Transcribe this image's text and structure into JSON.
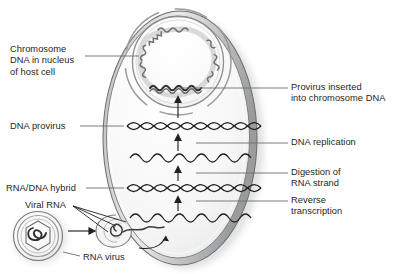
{
  "figure": {
    "type": "biological-process-diagram"
  },
  "colors": {
    "ink": "#231f20",
    "membrane_dark": "#58595b",
    "membrane_mid": "#8c8d8f",
    "membrane_light": "#d9dada",
    "cytoplasm": "#f2f2f2",
    "nucleus_fill": "#fbfbfb",
    "leader_line": "#6d6e70",
    "shadow": "#c9cacb",
    "page_bg": "#ffffff"
  },
  "labels": {
    "chromosome": {
      "lines": [
        "Chromosome",
        "DNA in nucleus",
        "of host cell"
      ],
      "side": "left"
    },
    "dna_provirus": {
      "lines": [
        "DNA provirus"
      ],
      "side": "left"
    },
    "rna_dna_hybrid": {
      "lines": [
        "RNA/DNA hybrid"
      ],
      "side": "left"
    },
    "viral_rna": {
      "lines": [
        "Viral RNA"
      ],
      "side": "left"
    },
    "rna_virus": {
      "lines": [
        "RNA virus"
      ],
      "side": "bottom-left"
    },
    "provirus_inserted": {
      "lines": [
        "Provirus inserted",
        "into chromosome DNA"
      ],
      "side": "right"
    },
    "dna_replication": {
      "lines": [
        "DNA replication"
      ],
      "side": "right"
    },
    "digestion": {
      "lines": [
        "Digestion of",
        "RNA strand"
      ],
      "side": "right"
    },
    "reverse_transcription": {
      "lines": [
        "Reverse",
        "transcription"
      ],
      "side": "right"
    }
  },
  "structures": {
    "cell": "host-cell-oval",
    "nucleus": "nucleus-circle",
    "chromosome_ring": "wavy-chromosome-loop",
    "virus_particle": "enveloped-rna-virus",
    "fusion_site": "virus-membrane-fusion"
  },
  "strands": [
    {
      "id": "provirus-dna",
      "kind": "double-helix",
      "label": "DNA provirus"
    },
    {
      "id": "single-dna",
      "kind": "single-wave",
      "label": "DNA strand after digestion"
    },
    {
      "id": "hybrid",
      "kind": "double-helix",
      "label": "RNA/DNA hybrid"
    },
    {
      "id": "viral-rna",
      "kind": "single-wave",
      "label": "Viral RNA"
    }
  ],
  "steps": [
    {
      "order": 1,
      "name": "Reverse transcription"
    },
    {
      "order": 2,
      "name": "Digestion of RNA strand"
    },
    {
      "order": 3,
      "name": "DNA replication"
    },
    {
      "order": 4,
      "name": "Provirus inserted into chromosome DNA"
    }
  ]
}
